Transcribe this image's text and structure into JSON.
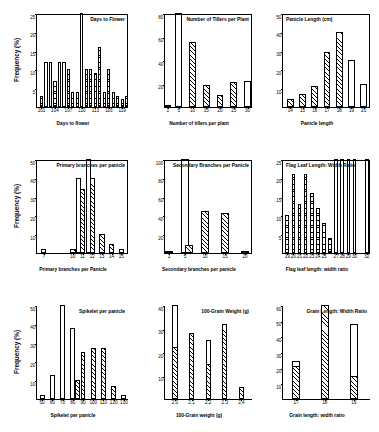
{
  "figure": {
    "ylabel": "Frequency (%)",
    "rows": 3,
    "cols": 3
  },
  "chart_data": [
    {
      "type": "bar",
      "panel": 1,
      "title": "Days to Flower",
      "xlabel": "Days to flower",
      "ylabel": "Frequency (%)",
      "ylim": [
        0,
        25
      ],
      "yticks": [
        5,
        10,
        15,
        20,
        25
      ],
      "xlim": [
        100,
        120.5
      ],
      "xticks": [
        101,
        104,
        107,
        110,
        113,
        116,
        119
      ],
      "grid": false,
      "legend": "none",
      "categories": [
        101,
        102,
        103,
        104,
        105,
        106,
        107,
        108,
        109,
        110,
        111,
        112,
        113,
        114,
        115,
        116,
        117,
        118,
        119,
        120
      ],
      "values": [
        3,
        12,
        12,
        7,
        12,
        12,
        10,
        4,
        4,
        25,
        10,
        10,
        9,
        16,
        4,
        10,
        4,
        3,
        2,
        3
      ],
      "fills": [
        "dots",
        "open",
        "open",
        "dots",
        "open",
        "open",
        "dots",
        "dots",
        "dots",
        "open",
        "dots",
        "dots",
        "dots",
        "dots",
        "dots",
        "dots",
        "dots",
        "dots",
        "dots",
        "dots"
      ]
    },
    {
      "type": "bar",
      "panel": 2,
      "title": "Number of Tillers per Plant",
      "xlabel": "Number of tillers per plant",
      "ylabel": "Frequency (%)",
      "ylim": [
        0,
        80
      ],
      "yticks": [
        20,
        40,
        60,
        80
      ],
      "xlim": [
        0,
        32
      ],
      "xticks": [
        1,
        5,
        10,
        15,
        20,
        25,
        30
      ],
      "grid": false,
      "legend": "none",
      "categories": [
        1,
        5,
        10,
        15,
        20,
        25,
        30
      ],
      "values": [
        2,
        80,
        55,
        19,
        10,
        21,
        22
      ],
      "fills": [
        "hatch",
        "open",
        "hatch",
        "hatch",
        "hatch",
        "hatch",
        "open"
      ]
    },
    {
      "type": "bar",
      "panel": 3,
      "title": "Panicle Length (cm)",
      "xlabel": "Panicle length",
      "ylabel": "Frequency (%)",
      "ylim": [
        0,
        50
      ],
      "yticks": [
        10,
        20,
        30,
        40,
        50
      ],
      "xlim": [
        13.4,
        20.6
      ],
      "xticks": [
        14,
        15,
        16,
        17,
        18,
        19,
        20
      ],
      "grid": false,
      "legend": "none",
      "categories": [
        14,
        15,
        16,
        17,
        18,
        19,
        20
      ],
      "values": [
        4,
        7,
        11,
        29,
        40,
        25,
        12
      ],
      "fills": [
        "hatch",
        "hatch",
        "hatch",
        "hatch",
        "hatch",
        "open",
        "open"
      ]
    },
    {
      "type": "bar",
      "panel": 4,
      "title": "Primary branches per panicle",
      "xlabel": "Primary branches per Panicle",
      "ylabel": "Frequency (%)",
      "ylim": [
        0,
        50
      ],
      "yticks": [
        10,
        20,
        30,
        40,
        50
      ],
      "xlim": [
        6.3,
        15.8
      ],
      "xticks": [
        7,
        10,
        11,
        12,
        13,
        14,
        15
      ],
      "grid": false,
      "legend": "none",
      "categories": [
        7,
        10,
        10.6,
        11,
        11.6,
        12,
        13,
        14,
        15
      ],
      "values": [
        2,
        2,
        40,
        34,
        50,
        40,
        10,
        5,
        2
      ],
      "fills": [
        "hatch",
        "hatch",
        "open",
        "hatch",
        "open",
        "hatch",
        "hatch",
        "hatch",
        "hatch"
      ]
    },
    {
      "type": "bar",
      "panel": 5,
      "title": "Secondary Branches per Panicle",
      "xlabel": "Secondary branches per panicle",
      "ylabel": "Frequency (%)",
      "ylim": [
        0,
        100
      ],
      "yticks": [
        20,
        40,
        60,
        80,
        100
      ],
      "xlim": [
        0,
        22
      ],
      "xticks": [
        1,
        5,
        10,
        15,
        20
      ],
      "grid": false,
      "legend": "none",
      "categories": [
        1,
        5,
        6,
        10,
        15,
        20
      ],
      "values": [
        2,
        100,
        8,
        45,
        43,
        2
      ],
      "fills": [
        "hatch",
        "open",
        "hatch",
        "hatch",
        "hatch",
        "hatch"
      ]
    },
    {
      "type": "bar",
      "panel": 6,
      "title": "Flag Leaf Length: Width Ratio",
      "xlabel": "Flag leaf length: width ratio",
      "ylabel": "Frequency (%)",
      "ylim": [
        0,
        25
      ],
      "yticks": [
        5,
        10,
        15,
        20,
        25
      ],
      "xlim": [
        18.3,
        32.7
      ],
      "xticks": [
        19,
        20,
        21,
        22,
        23,
        24,
        25,
        27,
        28,
        29,
        30,
        32
      ],
      "grid": false,
      "legend": "none",
      "categories": [
        19,
        20,
        21,
        22,
        23,
        24,
        25,
        26,
        27,
        28,
        29,
        30,
        32
      ],
      "values": [
        10,
        21,
        13,
        21,
        16,
        12,
        8,
        4,
        25,
        25,
        25,
        25,
        25
      ],
      "fills": [
        "dots",
        "dots",
        "dots",
        "dots",
        "dots",
        "dots",
        "dots",
        "dots",
        "open",
        "open",
        "open",
        "open",
        "open"
      ]
    },
    {
      "type": "bar",
      "panel": 7,
      "title": "Spikelet per panicle",
      "xlabel": "Spikelet per panicle",
      "ylabel": "Frequency (%)",
      "ylim": [
        0,
        50
      ],
      "yticks": [
        10,
        20,
        30,
        40,
        50
      ],
      "xlim": [
        45,
        135
      ],
      "xticks": [
        50,
        60,
        70,
        80,
        90,
        100,
        110,
        120,
        130
      ],
      "grid": false,
      "legend": "none",
      "categories": [
        50,
        60,
        70,
        80,
        85,
        90,
        100,
        110,
        120,
        130
      ],
      "values": [
        2,
        13,
        50,
        38,
        10,
        25,
        27,
        27,
        7,
        2
      ],
      "fills": [
        "hatch",
        "open",
        "open",
        "open",
        "hatch",
        "hatch",
        "hatch",
        "hatch",
        "hatch",
        "hatch"
      ]
    },
    {
      "type": "bar",
      "panel": 8,
      "title": "100-Grain Weight (g)",
      "xlabel": "100-Grain weight (g)",
      "ylabel": "Frequency (%)",
      "ylim": [
        0,
        40
      ],
      "yticks": [
        10,
        20,
        30,
        40
      ],
      "xlim": [
        1.94,
        2.47
      ],
      "xticks": [
        "2.0",
        "2.1",
        "2.2",
        "2.3",
        "2.4"
      ],
      "grid": false,
      "legend": "none",
      "categories": [
        "2.0a",
        "2.0b",
        "2.1a",
        "2.1b",
        "2.2a",
        "2.2b",
        "2.3a",
        "2.3b",
        "2.4"
      ],
      "values": [
        40,
        22,
        25,
        28,
        25,
        15,
        12,
        32,
        5
      ],
      "fills": [
        "open",
        "hatch",
        "open",
        "hatch",
        "open",
        "hatch",
        "open",
        "hatch",
        "hatch"
      ]
    },
    {
      "type": "bar",
      "panel": 9,
      "title": "Grain Length: Width Ratio",
      "xlabel": "Grain length: width ratio",
      "ylabel": "Frequency (%)",
      "ylim": [
        0,
        60
      ],
      "yticks": [
        10,
        20,
        30,
        40,
        50,
        60
      ],
      "xlim": [
        16.55,
        19.6
      ],
      "xticks": [
        17,
        18,
        19
      ],
      "grid": false,
      "legend": "none",
      "categories": [
        "17a",
        "17b",
        "18a",
        "18b",
        "19a",
        "19b"
      ],
      "values": [
        24,
        21,
        24,
        60,
        48,
        15
      ],
      "fills": [
        "open",
        "hatch",
        "open",
        "hatch",
        "open",
        "hatch"
      ]
    }
  ]
}
